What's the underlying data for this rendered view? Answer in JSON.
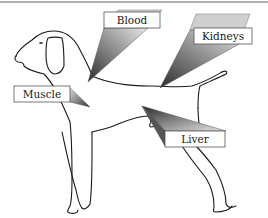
{
  "figure": {
    "labels": [
      {
        "id": "blood",
        "text": "Blood"
      },
      {
        "id": "kidneys",
        "text": "Kidneys"
      },
      {
        "id": "muscle",
        "text": "Muscle"
      },
      {
        "id": "liver",
        "text": "Liver"
      }
    ]
  },
  "colors": {
    "outline": "#1a1a1a",
    "label_box_fill": "#ffffff",
    "label_box_border": "#555555",
    "wedge_dark": "#3a3a3a",
    "wedge_light": "#e6e6e6",
    "top_rule": "#555555"
  }
}
